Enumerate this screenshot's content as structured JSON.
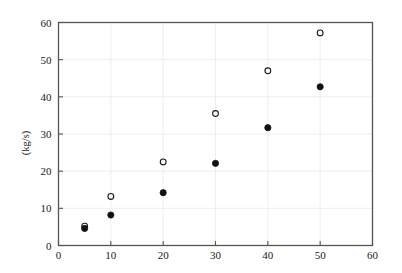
{
  "chart_data": {
    "type": "scatter",
    "title": "",
    "xlabel": "",
    "ylabel": "(kg/s)",
    "xlim": [
      0,
      60
    ],
    "ylim": [
      0,
      60
    ],
    "xticks": [
      0,
      10,
      20,
      30,
      40,
      50,
      60
    ],
    "yticks": [
      0,
      10,
      20,
      30,
      40,
      50,
      60
    ],
    "grid": true,
    "legend": "none",
    "series": [
      {
        "name": "open-circle-series",
        "marker": "open-circle",
        "color": "#1a1a1a",
        "points": [
          {
            "x": 5,
            "y": 5.2
          },
          {
            "x": 10,
            "y": 13.2
          },
          {
            "x": 20,
            "y": 22.5
          },
          {
            "x": 30,
            "y": 35.5
          },
          {
            "x": 40,
            "y": 47.0
          },
          {
            "x": 50,
            "y": 57.2
          }
        ]
      },
      {
        "name": "filled-circle-series",
        "marker": "filled-circle",
        "color": "#111111",
        "points": [
          {
            "x": 5,
            "y": 4.6
          },
          {
            "x": 10,
            "y": 8.2
          },
          {
            "x": 20,
            "y": 14.2
          },
          {
            "x": 30,
            "y": 22.1
          },
          {
            "x": 40,
            "y": 31.7
          },
          {
            "x": 50,
            "y": 42.7
          }
        ]
      }
    ]
  },
  "figure": {
    "axis_color": "#555555",
    "grid_color": "#eeeeee",
    "background": "#ffffff"
  },
  "labels": {
    "y_axis_title": "(kg/s)",
    "x_tick_texts": [
      "0",
      "10",
      "20",
      "30",
      "40",
      "50",
      "60"
    ],
    "y_tick_texts": [
      "0",
      "10",
      "20",
      "30",
      "40",
      "50",
      "60"
    ]
  }
}
